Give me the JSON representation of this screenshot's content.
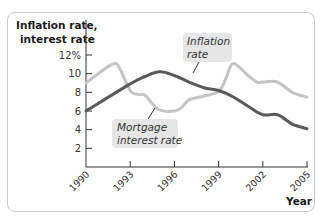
{
  "chart_data": {
    "type": "line",
    "title": "",
    "ylabel": "Inflation rate, interest rate",
    "xlabel": "Year",
    "ylim": [
      0,
      12
    ],
    "xlim": [
      1990,
      2005
    ],
    "grid": false,
    "y_ticks": [
      "2",
      "4",
      "6",
      "8",
      "10",
      "12%"
    ],
    "y_tick_values": [
      2,
      4,
      6,
      8,
      10,
      12
    ],
    "x_ticks": [
      "1990",
      "1993",
      "1996",
      "1999",
      "2002",
      "2005"
    ],
    "x_tick_values": [
      1990,
      1993,
      1996,
      1999,
      2002,
      2005
    ],
    "series": [
      {
        "name": "Inflation rate",
        "color": "#5a5a5a",
        "x": [
          1990,
          1993,
          1994,
          1995,
          1996,
          1997,
          1998,
          1999,
          2000,
          2001,
          2002,
          2003,
          2004,
          2005
        ],
        "values": [
          6.0,
          8.9,
          9.7,
          10.2,
          9.8,
          9.1,
          8.5,
          8.2,
          7.5,
          6.5,
          5.6,
          5.6,
          4.6,
          4.1
        ]
      },
      {
        "name": "Mortgage interest rate",
        "color": "#c4c4c4",
        "x": [
          1990,
          1991,
          1991.8,
          1992.2,
          1993,
          1993.5,
          1994,
          1994.5,
          1995,
          1996,
          1996.5,
          1997,
          1998,
          1999,
          1999.5,
          2000,
          2001,
          2001.6,
          2002,
          2003,
          2004,
          2005
        ],
        "values": [
          9.0,
          10.2,
          11.0,
          10.8,
          8.2,
          7.8,
          7.7,
          6.8,
          6.1,
          6.0,
          6.4,
          7.2,
          7.6,
          8.1,
          9.5,
          11.1,
          9.8,
          9.1,
          9.1,
          9.1,
          8.0,
          7.5
        ]
      }
    ],
    "annotations": [
      {
        "text_line1": "Inflation",
        "text_line2": "rate",
        "points_to": "Inflation rate"
      },
      {
        "text_line1": "Mortgage",
        "text_line2": "interest rate",
        "points_to": "Mortgage interest rate"
      }
    ]
  },
  "labels": {
    "ylabel_line1": "Inflation rate,",
    "ylabel_line2": "interest rate",
    "xlabel": "Year",
    "anno_inflation_1": "Inflation",
    "anno_inflation_2": "rate",
    "anno_mortgage_1": "Mortgage",
    "anno_mortgage_2": "interest rate"
  }
}
